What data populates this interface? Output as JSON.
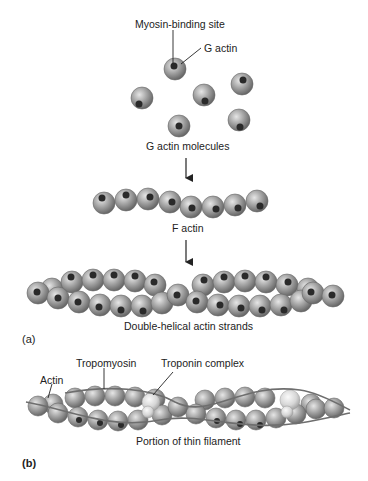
{
  "diagram": {
    "panel_a": {
      "label": "(a)",
      "callouts": {
        "myosin_binding_site": "Myosin-binding site",
        "g_actin": "G actin"
      },
      "stages": [
        {
          "caption": "G actin molecules"
        },
        {
          "caption": "F actin"
        },
        {
          "caption": "Double-helical actin strands"
        }
      ]
    },
    "panel_b": {
      "label": "(b)",
      "callouts": {
        "actin": "Actin",
        "tropomyosin": "Tropomyosin",
        "troponin_complex": "Troponin complex"
      },
      "caption": "Portion of thin filament"
    },
    "colors": {
      "actin_sphere": "#9a9a9a",
      "binding_site": "#2a2a2a",
      "troponin": "#dcdcdc",
      "tropomyosin_strand": "#6e6e6e"
    }
  }
}
